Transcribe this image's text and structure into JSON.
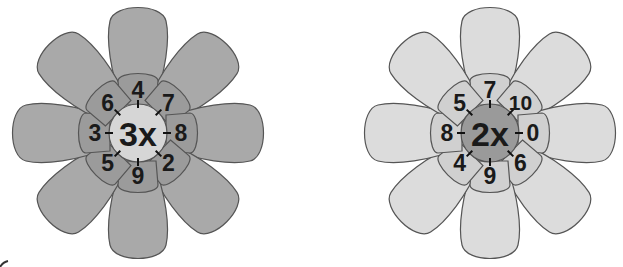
{
  "flowers": [
    {
      "id": "left",
      "center_label": "3x",
      "cx": 138,
      "cy": 133,
      "petal_color": "#a9a9a9",
      "inner_color": "#9b9b9b",
      "center_color": "#d6d6d6",
      "petals": [
        {
          "angle": 0,
          "label": "4"
        },
        {
          "angle": 45,
          "label": "7"
        },
        {
          "angle": 90,
          "label": "8"
        },
        {
          "angle": 135,
          "label": "2"
        },
        {
          "angle": 180,
          "label": "9"
        },
        {
          "angle": 225,
          "label": "5"
        },
        {
          "angle": 270,
          "label": "3"
        },
        {
          "angle": 315,
          "label": "6"
        }
      ]
    },
    {
      "id": "right",
      "center_label": "2x",
      "cx": 490,
      "cy": 133,
      "petal_color": "#dcdcdc",
      "inner_color": "#d0d0d0",
      "center_color": "#9a9a9a",
      "petals": [
        {
          "angle": 0,
          "label": "7"
        },
        {
          "angle": 45,
          "label": "10"
        },
        {
          "angle": 90,
          "label": "0"
        },
        {
          "angle": 135,
          "label": "6"
        },
        {
          "angle": 180,
          "label": "9"
        },
        {
          "angle": 225,
          "label": "4"
        },
        {
          "angle": 270,
          "label": "8"
        },
        {
          "angle": 315,
          "label": "5"
        }
      ]
    }
  ]
}
